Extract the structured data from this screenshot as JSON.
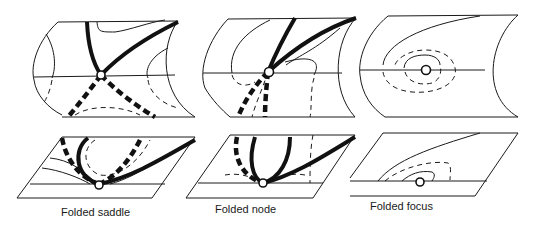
{
  "figure": {
    "panels": [
      {
        "id": "saddle",
        "label": "Folded saddle"
      },
      {
        "id": "node",
        "label": "Folded node"
      },
      {
        "id": "focus",
        "label": "Folded focus"
      }
    ]
  }
}
